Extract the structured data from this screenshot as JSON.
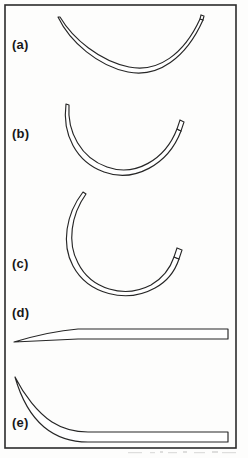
{
  "figure": {
    "background_color": "#fdfdfc",
    "frame": {
      "name": "figure-border",
      "stroke_color": "#2b2b2b",
      "stroke_width": 1.6,
      "x": 5,
      "y": 5,
      "width": 231,
      "height": 443
    },
    "ink_color": "#262626",
    "panels": [
      {
        "id": "a",
        "label": "(a)",
        "shape_name": "shallow-arc-needle",
        "description": "1/4 circle shallow curved needle, sharp tapered point at left, squared swage end at upper right",
        "curvature": "1/4 circle",
        "point_end": "left",
        "swage_end": "right"
      },
      {
        "id": "b",
        "label": "(b)",
        "shape_name": "half-circle-needle",
        "description": "3/8 to 1/2 circle curved needle, sharp tapered point at upper left, squared swage end at upper right",
        "curvature": "3/8 circle",
        "point_end": "upper-left",
        "swage_end": "upper-right"
      },
      {
        "id": "c",
        "label": "(c)",
        "shape_name": "five-eighths-circle-needle",
        "description": "5/8 circle deeply curved needle, sharp tapered point at upper left, squared swage end at upper right",
        "curvature": "5/8 circle",
        "point_end": "upper-left",
        "swage_end": "upper-right"
      },
      {
        "id": "d",
        "label": "(d)",
        "shape_name": "straight-needle",
        "description": "Straight needle with sharp tapered point at left and squared swage end at right",
        "curvature": "straight",
        "point_end": "left",
        "swage_end": "right"
      },
      {
        "id": "e",
        "label": "(e)",
        "shape_name": "half-curved-ski-needle",
        "description": "Half curved ski needle, curved tapered point rising at left, straight body with squared swage end at right",
        "curvature": "half curved (ski)",
        "point_end": "upper-left",
        "swage_end": "right"
      }
    ]
  }
}
